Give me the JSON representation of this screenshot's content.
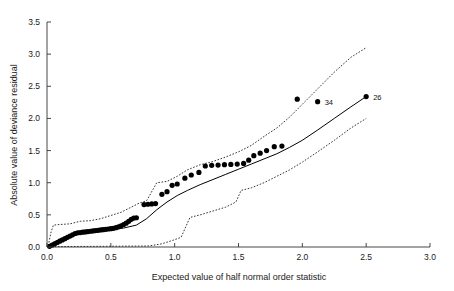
{
  "chart_data": {
    "type": "scatter",
    "title": "",
    "subtitle": "",
    "xlabel": "Expected value of half normal order statistic",
    "ylabel": "Absolute value of deviance residual",
    "xlim": [
      0.0,
      3.0
    ],
    "ylim": [
      0.0,
      3.5
    ],
    "xticks": [
      0.0,
      0.5,
      1.0,
      1.5,
      2.0,
      2.5,
      3.0
    ],
    "xticklabels": [
      "0.0",
      "0.5",
      "1.0",
      "1.5",
      "2.0",
      "2.5",
      "3.0"
    ],
    "yticks": [
      0.0,
      0.5,
      1.0,
      1.5,
      2.0,
      2.5,
      3.0,
      3.5
    ],
    "yticklabels": [
      "0.0",
      "0.5",
      "1.0",
      "1.5",
      "2.0",
      "2.5",
      "3.0",
      "3.5"
    ],
    "grid": false,
    "legend": null,
    "legend_position": "none",
    "marker": "filled-circle",
    "marker_color": "#000000",
    "line_color": "#000000",
    "envelope_style": "dotted",
    "series": [
      {
        "name": "observed absolute deviance residuals",
        "type": "scatter",
        "points": [
          [
            0.02,
            0.01
          ],
          [
            0.04,
            0.03
          ],
          [
            0.06,
            0.05
          ],
          [
            0.08,
            0.07
          ],
          [
            0.1,
            0.09
          ],
          [
            0.12,
            0.11
          ],
          [
            0.14,
            0.13
          ],
          [
            0.16,
            0.15
          ],
          [
            0.18,
            0.17
          ],
          [
            0.2,
            0.19
          ],
          [
            0.22,
            0.21
          ],
          [
            0.24,
            0.22
          ],
          [
            0.26,
            0.225
          ],
          [
            0.28,
            0.23
          ],
          [
            0.3,
            0.235
          ],
          [
            0.32,
            0.24
          ],
          [
            0.34,
            0.245
          ],
          [
            0.36,
            0.25
          ],
          [
            0.38,
            0.255
          ],
          [
            0.4,
            0.26
          ],
          [
            0.42,
            0.265
          ],
          [
            0.44,
            0.27
          ],
          [
            0.46,
            0.275
          ],
          [
            0.48,
            0.28
          ],
          [
            0.5,
            0.285
          ],
          [
            0.52,
            0.29
          ],
          [
            0.54,
            0.3
          ],
          [
            0.56,
            0.315
          ],
          [
            0.58,
            0.33
          ],
          [
            0.6,
            0.35
          ],
          [
            0.62,
            0.37
          ],
          [
            0.64,
            0.4
          ],
          [
            0.66,
            0.43
          ],
          [
            0.68,
            0.45
          ],
          [
            0.7,
            0.455
          ],
          [
            0.76,
            0.66
          ],
          [
            0.79,
            0.665
          ],
          [
            0.82,
            0.67
          ],
          [
            0.85,
            0.675
          ],
          [
            0.9,
            0.82
          ],
          [
            0.94,
            0.86
          ],
          [
            0.98,
            0.96
          ],
          [
            1.02,
            0.98
          ],
          [
            1.08,
            1.07
          ],
          [
            1.13,
            1.12
          ],
          [
            1.19,
            1.16
          ],
          [
            1.24,
            1.26
          ],
          [
            1.29,
            1.27
          ],
          [
            1.34,
            1.275
          ],
          [
            1.39,
            1.28
          ],
          [
            1.44,
            1.285
          ],
          [
            1.49,
            1.29
          ],
          [
            1.54,
            1.3
          ],
          [
            1.58,
            1.35
          ],
          [
            1.62,
            1.42
          ],
          [
            1.67,
            1.46
          ],
          [
            1.72,
            1.5
          ],
          [
            1.78,
            1.56
          ],
          [
            1.84,
            1.57
          ],
          [
            1.96,
            2.3
          ],
          [
            2.12,
            2.26
          ],
          [
            2.5,
            2.34
          ]
        ]
      },
      {
        "name": "simulated mean",
        "type": "line",
        "points": [
          [
            0.0,
            0.0
          ],
          [
            0.05,
            0.07
          ],
          [
            0.1,
            0.12
          ],
          [
            0.16,
            0.16
          ],
          [
            0.22,
            0.19
          ],
          [
            0.3,
            0.215
          ],
          [
            0.4,
            0.24
          ],
          [
            0.5,
            0.265
          ],
          [
            0.6,
            0.295
          ],
          [
            0.7,
            0.34
          ],
          [
            0.78,
            0.44
          ],
          [
            0.86,
            0.58
          ],
          [
            0.94,
            0.7
          ],
          [
            1.02,
            0.8
          ],
          [
            1.1,
            0.88
          ],
          [
            1.2,
            0.97
          ],
          [
            1.3,
            1.05
          ],
          [
            1.4,
            1.13
          ],
          [
            1.5,
            1.21
          ],
          [
            1.6,
            1.29
          ],
          [
            1.7,
            1.37
          ],
          [
            1.8,
            1.45
          ],
          [
            1.9,
            1.55
          ],
          [
            2.0,
            1.66
          ],
          [
            2.12,
            1.82
          ],
          [
            2.25,
            2.0
          ],
          [
            2.38,
            2.18
          ],
          [
            2.5,
            2.34
          ]
        ]
      },
      {
        "name": "upper simulation envelope",
        "type": "line-dotted",
        "points": [
          [
            0.01,
            0.02
          ],
          [
            0.03,
            0.22
          ],
          [
            0.05,
            0.34
          ],
          [
            0.1,
            0.35
          ],
          [
            0.18,
            0.36
          ],
          [
            0.26,
            0.4
          ],
          [
            0.34,
            0.41
          ],
          [
            0.42,
            0.44
          ],
          [
            0.5,
            0.49
          ],
          [
            0.58,
            0.54
          ],
          [
            0.66,
            0.62
          ],
          [
            0.72,
            0.68
          ],
          [
            0.78,
            0.72
          ],
          [
            0.86,
            1.0
          ],
          [
            0.94,
            1.02
          ],
          [
            1.02,
            1.1
          ],
          [
            1.1,
            1.2
          ],
          [
            1.2,
            1.28
          ],
          [
            1.3,
            1.33
          ],
          [
            1.4,
            1.4
          ],
          [
            1.5,
            1.48
          ],
          [
            1.6,
            1.58
          ],
          [
            1.7,
            1.72
          ],
          [
            1.8,
            1.85
          ],
          [
            1.9,
            2.02
          ],
          [
            2.0,
            2.22
          ],
          [
            2.12,
            2.46
          ],
          [
            2.25,
            2.72
          ],
          [
            2.38,
            2.95
          ],
          [
            2.5,
            3.1
          ]
        ]
      },
      {
        "name": "lower simulation envelope",
        "type": "line-dotted",
        "points": [
          [
            0.01,
            0.005
          ],
          [
            0.2,
            0.008
          ],
          [
            0.4,
            0.01
          ],
          [
            0.6,
            0.013
          ],
          [
            0.8,
            0.016
          ],
          [
            0.9,
            0.05
          ],
          [
            0.98,
            0.1
          ],
          [
            1.05,
            0.15
          ],
          [
            1.12,
            0.46
          ],
          [
            1.2,
            0.5
          ],
          [
            1.3,
            0.56
          ],
          [
            1.4,
            0.62
          ],
          [
            1.48,
            0.7
          ],
          [
            1.52,
            0.88
          ],
          [
            1.6,
            0.92
          ],
          [
            1.7,
            1.0
          ],
          [
            1.8,
            1.1
          ],
          [
            1.9,
            1.2
          ],
          [
            2.0,
            1.32
          ],
          [
            2.12,
            1.48
          ],
          [
            2.25,
            1.66
          ],
          [
            2.38,
            1.85
          ],
          [
            2.5,
            2.0
          ]
        ]
      }
    ],
    "annotations": [
      {
        "label": "34",
        "x": 2.12,
        "y": 2.26,
        "dx": 7,
        "dy": 3
      },
      {
        "label": "26",
        "x": 2.5,
        "y": 2.34,
        "dx": 7,
        "dy": 3
      }
    ]
  }
}
